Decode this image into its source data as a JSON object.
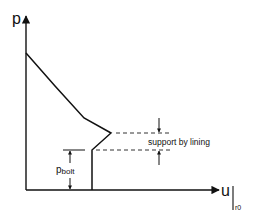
{
  "diagram": {
    "y_axis_label": "p",
    "x_axis_label": "u",
    "x_axis_subscript": "r0",
    "annotation_support": "support by lining",
    "annotation_bolt_main": "p",
    "annotation_bolt_sub": "bolt",
    "colors": {
      "line": "#111111",
      "dash": "#333333",
      "background": "#ffffff"
    }
  }
}
